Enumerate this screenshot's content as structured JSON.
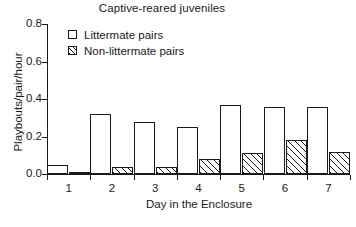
{
  "chart_data": {
    "type": "bar",
    "title": "Captive-reared juveniles",
    "xlabel": "Day in the Enclosure",
    "ylabel": "Playbouts/pair/hour",
    "categories": [
      "1",
      "2",
      "3",
      "4",
      "5",
      "6",
      "7"
    ],
    "series": [
      {
        "name": "Littermate pairs",
        "fill": "open",
        "values": [
          0.05,
          0.32,
          0.28,
          0.25,
          0.37,
          0.36,
          0.36
        ]
      },
      {
        "name": "Non-littermate pairs",
        "fill": "hatched",
        "values": [
          0.01,
          0.04,
          0.04,
          0.08,
          0.11,
          0.18,
          0.12
        ]
      }
    ],
    "ylim": [
      0.0,
      0.8
    ],
    "yticks": [
      "0.0",
      "0.2",
      "0.4",
      "0.6",
      "0.8"
    ],
    "ytick_values": [
      0.0,
      0.2,
      0.4,
      0.6,
      0.8
    ],
    "grid": false,
    "legend_position": "upper-left-inside",
    "axis_color": "#1a1a1a",
    "background": "#ffffff"
  },
  "legend": {
    "items": [
      {
        "label": "Littermate pairs"
      },
      {
        "label": "Non-littermate pairs"
      }
    ]
  }
}
